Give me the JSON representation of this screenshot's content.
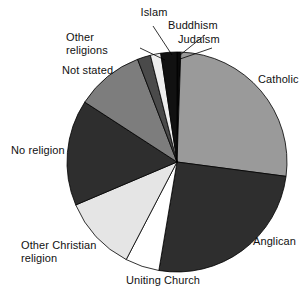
{
  "chart_data": {
    "type": "pie",
    "title": "",
    "subtitle": "",
    "xlabel": "",
    "ylabel": "",
    "legend_position": "none",
    "grid": false,
    "labels_placement": "outside-with-leader-lines",
    "units": "percent of persons",
    "categories": [
      "Judaism",
      "Catholic",
      "Anglican",
      "Uniting Church",
      "Other Christian religion",
      "No religion",
      "Not stated",
      "Other religions",
      "Islam",
      "Buddhism"
    ],
    "values": [
      0.5,
      26.5,
      25.5,
      5.0,
      11.0,
      15.5,
      10.0,
      2.0,
      1.5,
      2.5
    ],
    "slices": [
      {
        "label": "Judaism",
        "value": 0.5,
        "color": "#0a0a0a",
        "start_angle": 0.0,
        "end_angle": 2.0
      },
      {
        "label": "Catholic",
        "value": 26.5,
        "color": "#9a9a9a",
        "start_angle": 2.0,
        "end_angle": 97.5
      },
      {
        "label": "Anglican",
        "value": 25.5,
        "color": "#2e2e2e",
        "start_angle": 97.5,
        "end_angle": 189.5
      },
      {
        "label": "Uniting Church",
        "value": 5.0,
        "color": "#ffffff",
        "start_angle": 189.5,
        "end_angle": 207.5
      },
      {
        "label": "Other Christian religion",
        "value": 11.0,
        "color": "#e5e5e5",
        "start_angle": 207.5,
        "end_angle": 247.0
      },
      {
        "label": "No religion",
        "value": 15.5,
        "color": "#2e2e2e",
        "start_angle": 247.0,
        "end_angle": 303.0
      },
      {
        "label": "Not stated",
        "value": 10.0,
        "color": "#7d7d7d",
        "start_angle": 303.0,
        "end_angle": 339.0
      },
      {
        "label": "Other religions",
        "value": 2.0,
        "color": "#4a4a4a",
        "start_angle": 339.0,
        "end_angle": 346.0
      },
      {
        "label": "Islam",
        "value": 1.5,
        "color": "#eeeeee",
        "start_angle": 346.0,
        "end_angle": 351.5
      },
      {
        "label": "Buddhism",
        "value": 2.5,
        "color": "#111111",
        "start_angle": 351.5,
        "end_angle": 360.0
      }
    ],
    "geometry": {
      "center_x": 177,
      "center_y": 162,
      "radius": 110,
      "stroke_color": "#000000",
      "stroke_width": 0.8
    }
  },
  "labels": {
    "islam": "Islam",
    "buddhism": "Buddhism",
    "judaism": "Judaism",
    "other_religions": "Other\nreligions",
    "not_stated": "Not stated",
    "catholic": "Catholic",
    "no_religion": "No religion",
    "anglican": "Anglican",
    "other_christian": "Other Christian\nreligion",
    "uniting_church": "Uniting Church"
  },
  "colors": {
    "background": "#ffffff",
    "text": "#111111",
    "outline": "#000000",
    "catholic": "#9a9a9a",
    "anglican": "#2e2e2e",
    "uniting_church": "#ffffff",
    "other_christian": "#e5e5e5",
    "no_religion": "#2e2e2e",
    "not_stated": "#7d7d7d",
    "other_religions": "#4a4a4a",
    "islam": "#eeeeee",
    "buddhism": "#111111",
    "judaism": "#0a0a0a"
  }
}
